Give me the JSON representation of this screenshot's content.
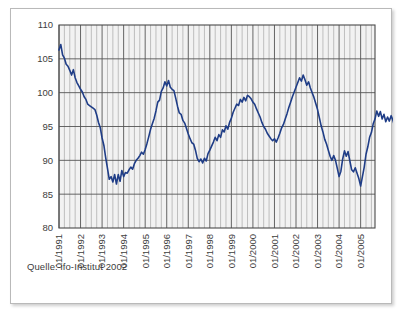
{
  "figure": {
    "source_note": "Quelle: ifo-Institut 2002"
  },
  "chart_data": {
    "type": "line",
    "title": "",
    "subtitle": "",
    "xlabel": "",
    "ylabel": "",
    "grid": true,
    "legend": false,
    "legend_position": "none",
    "line_color": "#1f3d87",
    "plot_background": "#f2f2f2",
    "ylim": [
      80,
      110
    ],
    "ytick_labels": [
      "80",
      "85",
      "90",
      "95",
      "100",
      "105",
      "110"
    ],
    "ytick_values": [
      80,
      85,
      90,
      95,
      100,
      105,
      110
    ],
    "xtick_labels": [
      "01/1991",
      "01/1992",
      "01/1993",
      "01/1994",
      "01/1995",
      "01/1996",
      "01/1997",
      "01/1998",
      "01/1999",
      "01/2000",
      "01/2001",
      "01/2002",
      "01/2003",
      "01/2004",
      "01/2005"
    ],
    "xtick_values": [
      0,
      12,
      24,
      36,
      48,
      60,
      72,
      84,
      96,
      108,
      120,
      132,
      144,
      156,
      168
    ],
    "x_minor_step_months": 3,
    "x_range_months": [
      0,
      176
    ],
    "x_start_label": "01/1991",
    "series": [
      {
        "name": "ifo Geschäftsklimaindex",
        "x_start_months": 0,
        "x_step_months": 1,
        "values": [
          106.3,
          107.1,
          105.6,
          105.1,
          104.2,
          103.9,
          103.3,
          102.6,
          103.4,
          102.2,
          101.5,
          101.0,
          100.5,
          100.1,
          99.4,
          99.0,
          98.3,
          98.1,
          97.9,
          97.7,
          97.5,
          96.7,
          95.6,
          94.8,
          93.3,
          92.2,
          90.4,
          88.8,
          87.2,
          87.6,
          86.8,
          87.9,
          86.5,
          87.9,
          86.9,
          88.5,
          87.6,
          88.2,
          88.1,
          88.6,
          89.0,
          88.7,
          89.5,
          90.0,
          90.3,
          90.7,
          91.2,
          90.9,
          91.6,
          92.5,
          93.5,
          94.6,
          95.4,
          96.2,
          97.3,
          98.6,
          98.9,
          100.2,
          100.7,
          101.6,
          101.0,
          101.8,
          100.8,
          100.5,
          100.3,
          99.2,
          98.0,
          97.0,
          96.8,
          95.9,
          95.5,
          94.7,
          93.9,
          93.2,
          92.6,
          92.4,
          91.5,
          90.3,
          89.8,
          90.2,
          89.6,
          90.3,
          89.9,
          91.0,
          91.5,
          92.1,
          92.7,
          93.4,
          92.9,
          93.8,
          93.4,
          94.5,
          94.2,
          95.1,
          94.6,
          95.6,
          96.2,
          97.1,
          97.7,
          98.3,
          98.1,
          99.0,
          98.6,
          99.3,
          98.8,
          99.6,
          99.4,
          99.1,
          98.6,
          98.3,
          97.6,
          97.0,
          96.4,
          95.6,
          95.0,
          94.6,
          94.0,
          93.6,
          93.2,
          92.9,
          93.2,
          92.7,
          93.3,
          94.0,
          94.8,
          95.3,
          96.1,
          96.9,
          97.8,
          98.6,
          99.4,
          100.1,
          100.8,
          101.5,
          102.2,
          101.7,
          102.6,
          101.9,
          101.1,
          101.6,
          100.7,
          100.0,
          99.3,
          98.4,
          97.5,
          96.3,
          95.1,
          94.2,
          93.1,
          92.4,
          91.5,
          90.6,
          90.0,
          90.7,
          90.0,
          88.8,
          87.6,
          88.4,
          90.2,
          91.4,
          90.6,
          91.3,
          89.9,
          88.6,
          88.3,
          88.9,
          88.1,
          87.3,
          86.2,
          87.6,
          89.0,
          90.9,
          92.0,
          93.4,
          94.1,
          95.4,
          96.1,
          97.3,
          96.5,
          97.2,
          96.1,
          96.8,
          95.7,
          96.4,
          95.8,
          96.6,
          95.9,
          95.0,
          94.3,
          95.1,
          94.7,
          95.6,
          95.0,
          96.0,
          95.4,
          96.2,
          97.4,
          98.6,
          98.9
        ]
      }
    ]
  }
}
